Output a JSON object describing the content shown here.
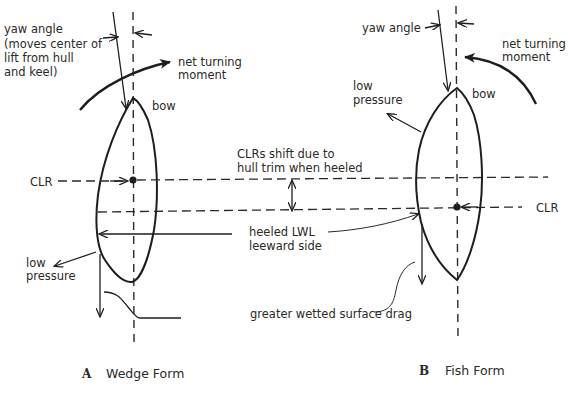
{
  "diagram": {
    "panel_a": {
      "letter": "A",
      "caption": "Wedge Form",
      "yaw_label_lines": [
        "yaw angle",
        "(moves center of",
        "lift from hull",
        "and keel)"
      ],
      "turning_label_lines": [
        "net turning",
        "moment"
      ],
      "bow_label": "bow",
      "clr_label": "CLR",
      "low_pressure_lines": [
        "low",
        "pressure"
      ]
    },
    "panel_b": {
      "letter": "B",
      "caption": "Fish Form",
      "yaw_label": "yaw angle",
      "turning_label_lines": [
        "net turning",
        "moment"
      ],
      "bow_label": "bow",
      "clr_label": "CLR",
      "low_pressure_lines": [
        "low",
        "pressure"
      ]
    },
    "shared": {
      "clr_shift_lines": [
        "CLRs shift due to",
        "hull trim when heeled"
      ],
      "lwl_lines": [
        "heeled LWL",
        "leeward side"
      ],
      "drag_label": "greater wetted surface drag"
    },
    "colors": {
      "ink": "#1e1e1e",
      "text": "#2a2a2a",
      "background": "#ffffff"
    }
  }
}
